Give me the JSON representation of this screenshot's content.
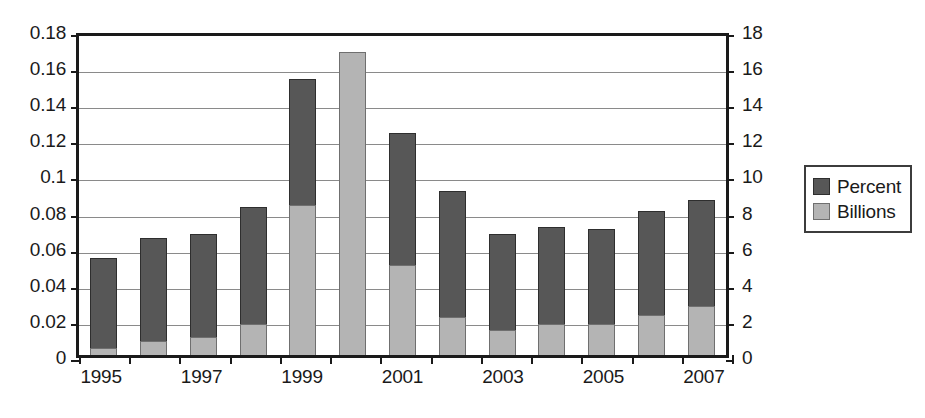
{
  "chart_data": {
    "type": "bar",
    "subtype": "stacked",
    "title": "",
    "xlabel": "",
    "ylabel": "",
    "grid": true,
    "legend_position": "right",
    "categories": [
      "1995",
      "1996",
      "1997",
      "1998",
      "1999",
      "2000",
      "2001",
      "2002",
      "2003",
      "2004",
      "2005",
      "2006",
      "2007"
    ],
    "x_tick_labels": [
      "1995",
      "",
      "1997",
      "",
      "1999",
      "",
      "2001",
      "",
      "2003",
      "",
      "2005",
      "",
      "2007"
    ],
    "axes": {
      "left": {
        "label": "",
        "ylim": [
          0,
          0.18
        ],
        "tick_step": 0.02,
        "tick_labels": [
          "0",
          "0.02",
          "0.04",
          "0.06",
          "0.08",
          "0.1",
          "0.12",
          "0.14",
          "0.16",
          "0.18"
        ],
        "tick_values": [
          0,
          0.02,
          0.04,
          0.06,
          0.08,
          0.1,
          0.12,
          0.14,
          0.16,
          0.18
        ],
        "series": "Percent"
      },
      "right": {
        "label": "",
        "ylim": [
          0,
          18
        ],
        "tick_step": 2,
        "tick_labels": [
          "0",
          "2",
          "4",
          "6",
          "8",
          "10",
          "12",
          "14",
          "16",
          "18"
        ],
        "tick_values": [
          0,
          2,
          4,
          6,
          8,
          10,
          12,
          14,
          16,
          18
        ],
        "series": "Billions"
      }
    },
    "series": [
      {
        "name": "Billions",
        "color": "#b4b4b4",
        "stack_order": 0,
        "axis": "right",
        "values_left_scale": [
          0.004,
          0.008,
          0.01,
          0.017,
          0.083,
          0.168,
          0.05,
          0.021,
          0.014,
          0.017,
          0.017,
          0.022,
          0.027
        ],
        "values": [
          0.4,
          0.8,
          1.0,
          1.7,
          8.3,
          16.8,
          5.0,
          2.1,
          1.4,
          1.7,
          1.7,
          2.2,
          2.7
        ]
      },
      {
        "name": "Percent",
        "color": "#575757",
        "stack_order": 1,
        "axis": "left",
        "values": [
          0.05,
          0.057,
          0.057,
          0.065,
          0.07,
          0.0,
          0.073,
          0.07,
          0.053,
          0.054,
          0.053,
          0.058,
          0.059
        ]
      }
    ],
    "totals": [
      0.054,
      0.065,
      0.067,
      0.082,
      0.153,
      0.168,
      0.123,
      0.091,
      0.067,
      0.071,
      0.07,
      0.08,
      0.086
    ]
  },
  "legend": {
    "items": [
      {
        "label": "Percent",
        "color": "#575757"
      },
      {
        "label": "Billions",
        "color": "#b4b4b4"
      }
    ]
  },
  "colors": {
    "dark_series": "#575757",
    "light_series": "#b4b4b4",
    "axis": "#1a1a1a",
    "gridline": "#8a8a8a",
    "background": "#ffffff"
  }
}
